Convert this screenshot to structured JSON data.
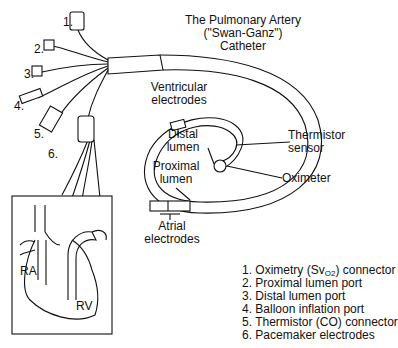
{
  "title": {
    "line1": "The Pulmonary Artery",
    "line2": "(\"Swan-Ganz\")",
    "line3": "Catheter"
  },
  "connector_numbers": [
    "1.",
    "2.",
    "3.",
    "4.",
    "5.",
    "6."
  ],
  "callouts": {
    "ventricular_1": "Ventricular",
    "ventricular_2": "electrodes",
    "distal_1": "Distal",
    "distal_2": "lumen",
    "proximal_1": "Proximal",
    "proximal_2": "lumen",
    "atrial_1": "Atrial",
    "atrial_2": "electrodes",
    "thermistor_1": "Thermistor",
    "thermistor_2": "sensor",
    "oximeter": "Oximeter"
  },
  "inset": {
    "ra_label": "RA",
    "rv_label": "RV"
  },
  "legend": [
    {
      "num": "1.",
      "pre": "Oximetry (Sv",
      "sub": "O2",
      "post": ") connector"
    },
    {
      "num": "2.",
      "pre": "Proximal lumen port",
      "sub": "",
      "post": ""
    },
    {
      "num": "3.",
      "pre": "Distal lumen port",
      "sub": "",
      "post": ""
    },
    {
      "num": "4.",
      "pre": "Balloon inflation port",
      "sub": "",
      "post": ""
    },
    {
      "num": "5.",
      "pre": "Thermistor (CO) connector",
      "sub": "",
      "post": ""
    },
    {
      "num": "6.",
      "pre": "Pacemaker electrodes",
      "sub": "",
      "post": ""
    }
  ],
  "colors": {
    "ink": "#111111",
    "background": "#ffffff"
  }
}
